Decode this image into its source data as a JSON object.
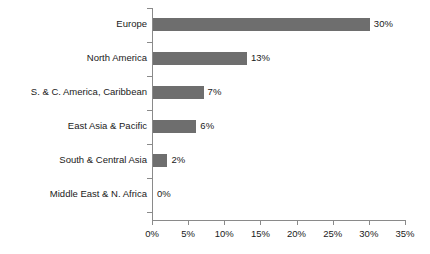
{
  "chart_data": {
    "type": "bar",
    "orientation": "horizontal",
    "title": "",
    "subtitle": "",
    "xlabel": "",
    "ylabel": "",
    "categories": [
      "Europe",
      "North America",
      "S. & C. America, Caribbean",
      "East Asia & Pacific",
      "South & Central Asia",
      "Middle East & N. Africa"
    ],
    "values": [
      30,
      13,
      7,
      6,
      2,
      0
    ],
    "data_labels": [
      "30%",
      "13%",
      "7%",
      "6%",
      "2%",
      "0%"
    ],
    "xlim": [
      0,
      35
    ],
    "xticks": [
      0,
      5,
      10,
      15,
      20,
      25,
      30,
      35
    ],
    "xtick_labels": [
      "0%",
      "5%",
      "10%",
      "15%",
      "20%",
      "25%",
      "30%",
      "35%"
    ],
    "grid": false,
    "legend": false,
    "legend_position": "none",
    "bar_color": "#6e6e6e",
    "axis_color": "#8a8a8a",
    "text_color": "#1a1a1a",
    "background_color": "#ffffff"
  }
}
